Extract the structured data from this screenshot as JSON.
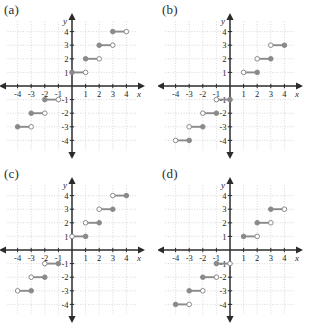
{
  "figure": {
    "kind": "multiple-choice-graph-set",
    "panels": [
      "a",
      "b",
      "c",
      "d"
    ]
  },
  "panel_labels": {
    "a": "(a)",
    "b": "(b)",
    "c": "(c)",
    "d": "(d)"
  },
  "axes": {
    "x_label": "x",
    "y_label": "y",
    "x_ticks": [
      "-4",
      "-3",
      "-2",
      "-1",
      "1",
      "2",
      "3",
      "4"
    ],
    "y_ticks": [
      "4",
      "3",
      "2",
      "1",
      "-1",
      "-2",
      "-3",
      "-4"
    ],
    "x_tick_values": [
      -4,
      -3,
      -2,
      -1,
      1,
      2,
      3,
      4
    ],
    "y_tick_values": [
      4,
      3,
      2,
      1,
      -1,
      -2,
      -3,
      -4
    ],
    "xlim": [
      -4.6,
      4.6
    ],
    "ylim": [
      -4.6,
      4.6
    ],
    "grid": true
  },
  "colors": {
    "segment": "#8a8a8a",
    "axis": "#2b2b2b",
    "grid": "#c9c9c9",
    "open_marker_fill": "#ffffff",
    "open_marker_stroke": "#8a8a8a",
    "closed_marker_fill": "#8a8a8a",
    "background": "#ffffff",
    "text": "#1f1f1f"
  },
  "chart_data": [
    {
      "id": "a",
      "type": "line",
      "title": "(a)",
      "xlabel": "x",
      "ylabel": "y",
      "xlim": [
        -4.6,
        4.6
      ],
      "ylim": [
        -4.6,
        4.6
      ],
      "grid": true,
      "description": "Step function, closed endpoint on left, open endpoint on right",
      "segments": [
        {
          "y": 4,
          "x_start": 3,
          "x_end": 4,
          "left": "closed",
          "right": "open"
        },
        {
          "y": 3,
          "x_start": 2,
          "x_end": 3,
          "left": "closed",
          "right": "open"
        },
        {
          "y": 2,
          "x_start": 1,
          "x_end": 2,
          "left": "closed",
          "right": "open"
        },
        {
          "y": 1,
          "x_start": 0,
          "x_end": 1,
          "left": "closed",
          "right": "open"
        },
        {
          "y": -1,
          "x_start": -2,
          "x_end": -1,
          "left": "closed",
          "right": "open"
        },
        {
          "y": -2,
          "x_start": -3,
          "x_end": -2,
          "left": "closed",
          "right": "open"
        },
        {
          "y": -3,
          "x_start": -4,
          "x_end": -3,
          "left": "closed",
          "right": "open"
        }
      ]
    },
    {
      "id": "b",
      "type": "line",
      "title": "(b)",
      "xlabel": "x",
      "ylabel": "y",
      "xlim": [
        -4.6,
        4.6
      ],
      "ylim": [
        -4.6,
        4.6
      ],
      "grid": true,
      "description": "Step function, open endpoint on left, closed endpoint on right",
      "segments": [
        {
          "y": 3,
          "x_start": 3,
          "x_end": 4,
          "left": "open",
          "right": "closed"
        },
        {
          "y": 2,
          "x_start": 2,
          "x_end": 3,
          "left": "open",
          "right": "closed"
        },
        {
          "y": 1,
          "x_start": 1,
          "x_end": 2,
          "left": "open",
          "right": "closed"
        },
        {
          "y": -1,
          "x_start": -1,
          "x_end": 0,
          "left": "open",
          "right": "closed"
        },
        {
          "y": -2,
          "x_start": -2,
          "x_end": -1,
          "left": "open",
          "right": "closed"
        },
        {
          "y": -3,
          "x_start": -3,
          "x_end": -2,
          "left": "open",
          "right": "closed"
        },
        {
          "y": -4,
          "x_start": -4,
          "x_end": -3,
          "left": "open",
          "right": "closed"
        }
      ]
    },
    {
      "id": "c",
      "type": "line",
      "title": "(c)",
      "xlabel": "x",
      "ylabel": "y",
      "xlim": [
        -4.6,
        4.6
      ],
      "ylim": [
        -4.6,
        4.6
      ],
      "grid": true,
      "description": "Step function, open endpoint on left, closed endpoint on right",
      "segments": [
        {
          "y": 4,
          "x_start": 3,
          "x_end": 4,
          "left": "open",
          "right": "closed"
        },
        {
          "y": 3,
          "x_start": 2,
          "x_end": 3,
          "left": "open",
          "right": "closed"
        },
        {
          "y": 2,
          "x_start": 1,
          "x_end": 2,
          "left": "open",
          "right": "closed"
        },
        {
          "y": 1,
          "x_start": 0,
          "x_end": 1,
          "left": "open",
          "right": "closed"
        },
        {
          "y": -1,
          "x_start": -2,
          "x_end": -1,
          "left": "open",
          "right": "closed"
        },
        {
          "y": -2,
          "x_start": -3,
          "x_end": -2,
          "left": "open",
          "right": "closed"
        },
        {
          "y": -3,
          "x_start": -4,
          "x_end": -3,
          "left": "open",
          "right": "closed"
        }
      ]
    },
    {
      "id": "d",
      "type": "line",
      "title": "(d)",
      "xlabel": "x",
      "ylabel": "y",
      "xlim": [
        -4.6,
        4.6
      ],
      "ylim": [
        -4.6,
        4.6
      ],
      "grid": true,
      "description": "Step function, closed endpoint on left, open endpoint on right",
      "segments": [
        {
          "y": 3,
          "x_start": 3,
          "x_end": 4,
          "left": "closed",
          "right": "open"
        },
        {
          "y": 2,
          "x_start": 2,
          "x_end": 3,
          "left": "closed",
          "right": "open"
        },
        {
          "y": 1,
          "x_start": 1,
          "x_end": 2,
          "left": "closed",
          "right": "open"
        },
        {
          "y": -1,
          "x_start": -1,
          "x_end": 0,
          "left": "closed",
          "right": "open"
        },
        {
          "y": -2,
          "x_start": -2,
          "x_end": -1,
          "left": "closed",
          "right": "open"
        },
        {
          "y": -3,
          "x_start": -3,
          "x_end": -2,
          "left": "closed",
          "right": "open"
        },
        {
          "y": -4,
          "x_start": -4,
          "x_end": -3,
          "left": "closed",
          "right": "open"
        }
      ]
    }
  ]
}
